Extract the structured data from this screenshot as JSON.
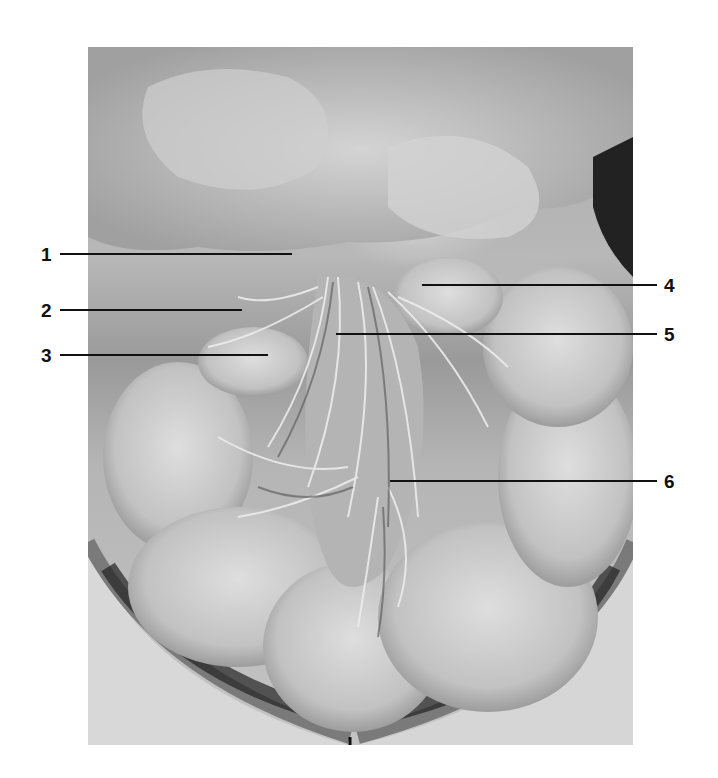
{
  "figure": {
    "labels": [
      {
        "number": "1",
        "side": "left",
        "y": 254,
        "line_x1": 60,
        "line_x2": 292
      },
      {
        "number": "2",
        "side": "left",
        "y": 310,
        "line_x1": 60,
        "line_x2": 242
      },
      {
        "number": "3",
        "side": "left",
        "y": 355,
        "line_x1": 60,
        "line_x2": 268
      },
      {
        "number": "4",
        "side": "right",
        "y": 285,
        "line_x1": 422,
        "line_x2": 657
      },
      {
        "number": "5",
        "side": "right",
        "y": 334,
        "line_x1": 336,
        "line_x2": 657
      },
      {
        "number": "6",
        "side": "right",
        "y": 481,
        "line_x1": 390,
        "line_x2": 657
      }
    ]
  }
}
